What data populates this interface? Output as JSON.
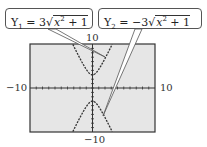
{
  "callouts": [
    {
      "label": "Y1 = 3√(x² + 1)",
      "name": "Y",
      "sub": "1",
      "prefix": " = 3",
      "radicand_var": "x",
      "radicand_exp": "2",
      "radicand_rest": " + 1"
    },
    {
      "label": "Y2 = −3√(x² + 1)",
      "name": "Y",
      "sub": "2",
      "prefix": " = −3",
      "radicand_var": "x",
      "radicand_exp": "2",
      "radicand_rest": " + 1"
    }
  ],
  "axes": {
    "ymax_label": "10",
    "ymin_label": "−10",
    "xmin_label": "−10",
    "xmax_label": "10"
  },
  "chart_data": {
    "type": "line",
    "title": "",
    "xlabel": "",
    "ylabel": "",
    "xlim": [
      -10,
      10
    ],
    "ylim": [
      -10,
      10
    ],
    "grid": false,
    "series": [
      {
        "name": "Y1 = 3√(x²+1)",
        "x": [
          -3.15,
          -3,
          -2,
          -1,
          0,
          1,
          2,
          3,
          3.15
        ],
        "values": [
          9.97,
          9.49,
          6.71,
          4.24,
          3,
          4.24,
          6.71,
          9.49,
          9.97
        ]
      },
      {
        "name": "Y2 = −3√(x²+1)",
        "x": [
          -3.15,
          -3,
          -2,
          -1,
          0,
          1,
          2,
          3,
          3.15
        ],
        "values": [
          -9.97,
          -9.49,
          -6.71,
          -4.24,
          -3,
          -4.24,
          -6.71,
          -9.49,
          -9.97
        ]
      }
    ],
    "colors": {
      "screen_bg": "#e6e6e6",
      "curve": "#333333",
      "axis": "#333333"
    }
  }
}
